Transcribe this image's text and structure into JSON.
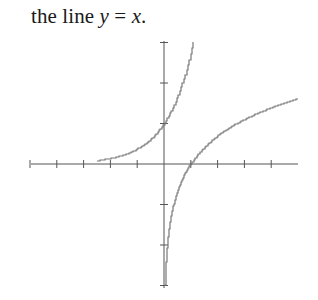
{
  "caption": {
    "prefix": "the line ",
    "var_y": "y",
    "equals": " = ",
    "var_x": "x",
    "suffix": "."
  },
  "chart_data": {
    "type": "line",
    "title": "",
    "xlabel": "",
    "ylabel": "",
    "xlim": [
      -5,
      5
    ],
    "ylim": [
      -3,
      3
    ],
    "grid": false,
    "x_ticks": [
      -5,
      -4,
      -3,
      -2,
      -1,
      1,
      2,
      3,
      4
    ],
    "y_ticks": [
      -3,
      -2,
      -1,
      1,
      2,
      3
    ],
    "series": [
      {
        "name": "y = e^x",
        "x": [
          -2.5,
          -2,
          -1.5,
          -1,
          -0.5,
          0,
          0.5,
          1,
          1.1
        ],
        "y": [
          0.08,
          0.14,
          0.22,
          0.37,
          0.61,
          1,
          1.65,
          2.72,
          3.0
        ]
      },
      {
        "name": "y = ln x",
        "x": [
          0.05,
          0.14,
          0.22,
          0.37,
          0.61,
          1,
          1.65,
          2.72,
          4,
          5
        ],
        "y": [
          -3,
          -2,
          -1.5,
          -1,
          -0.5,
          0,
          0.5,
          1,
          1.39,
          1.61
        ]
      }
    ],
    "style": "stair-stepped plotted curves, light gray"
  },
  "colors": {
    "axis": "#555555",
    "curve": "#777777",
    "text": "#1a1a1a"
  }
}
